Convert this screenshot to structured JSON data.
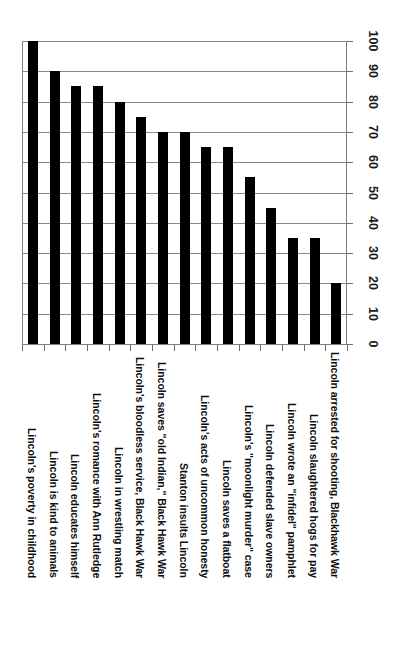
{
  "chart_data": {
    "type": "bar",
    "title": "",
    "subtitle": "",
    "xlabel": "",
    "ylabel": "",
    "ylim": [
      0,
      100
    ],
    "ytick_interval": 10,
    "yticks": [
      0,
      10,
      20,
      30,
      40,
      50,
      60,
      70,
      80,
      90,
      100
    ],
    "grid": true,
    "grid_axis": "y",
    "legend": false,
    "legend_position": "none",
    "orientation": "vertical",
    "value_axis_position": "right",
    "category_label_rotation": 90,
    "categories": [
      "Lincoln's poverty in childhood",
      "Lincoln is kind to animals",
      "Lincoln educates himself",
      "Lincoln's romance with Ann Rutledge",
      "Lincoln in wrestling match",
      "Lincoln's bloodless service, Black Hawk War",
      "Lincoln saves \"old Indian,\" Black Hawk War",
      "Stanton insults Lincoln",
      "Lincoln's acts of uncommon honesty",
      "Lincoln saves a flatboat",
      "Lincoln's \"moonlight murder\" case",
      "Lincoln defended slave owners",
      "Lincoln wrote an \"infidel\" pamphlet",
      "Lincoln slaughtered hogs for pay",
      "Lincoln arrested for shooting, Blackhawk War"
    ],
    "values": [
      100,
      90,
      85,
      85,
      80,
      75,
      70,
      70,
      65,
      65,
      55,
      45,
      35,
      35,
      20
    ],
    "series": [
      {
        "name": "",
        "values": [
          100,
          90,
          85,
          85,
          80,
          75,
          70,
          70,
          65,
          65,
          55,
          45,
          35,
          35,
          20
        ],
        "color": "#000000"
      }
    ],
    "colors": {
      "bar": "#000000",
      "gridline": "#8a8a8a",
      "axis": "#808080",
      "text": "#0d0d0d",
      "background": "#ffffff"
    }
  }
}
